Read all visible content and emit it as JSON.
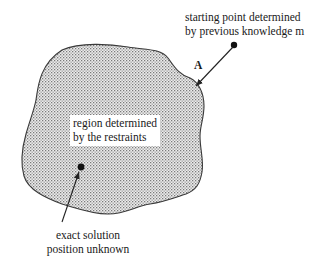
{
  "diagram": {
    "start_label": {
      "line1": "starting point determined",
      "line2": "by previous knowledge m"
    },
    "arrow_label": "A",
    "region_label": {
      "line1": "region determined",
      "line2": "by the restraints"
    },
    "solution_label": {
      "line1": "exact solution",
      "line2": "position unknown"
    },
    "colors": {
      "outline": "#3a3a3a",
      "fill_dots": "#8a8a8a",
      "fill_bg": "#e4e4e4",
      "text": "#1a1a1a"
    }
  }
}
